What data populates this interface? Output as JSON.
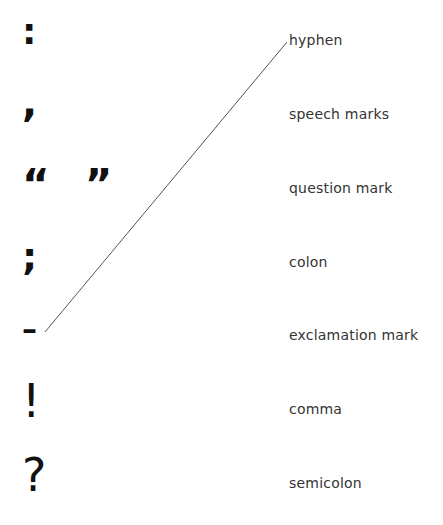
{
  "symbols": [
    {
      "glyph": ":",
      "name": "colon"
    },
    {
      "glyph": ",",
      "name": "comma"
    },
    {
      "glyph": "“  ”",
      "name": "speech-marks"
    },
    {
      "glyph": ";",
      "name": "semicolon"
    },
    {
      "glyph": "–",
      "name": "hyphen"
    },
    {
      "glyph": "!",
      "name": "exclamation-mark"
    },
    {
      "glyph": "?",
      "name": "question-mark"
    }
  ],
  "labels": [
    "hyphen",
    "speech marks",
    "question mark",
    "colon",
    "exclamation mark",
    "comma",
    "semicolon"
  ],
  "connections": [
    {
      "from_symbol": 4,
      "to_label": 0,
      "x1": 45,
      "y1": 332,
      "x2": 287,
      "y2": 42,
      "color": "#555555"
    }
  ]
}
